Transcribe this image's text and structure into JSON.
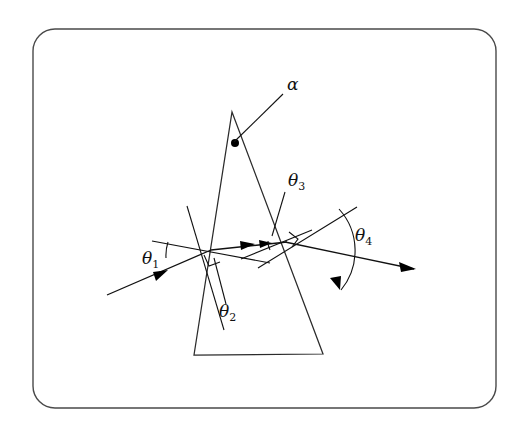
{
  "figure": {
    "kind": "optics-prism-refraction-diagram",
    "background_color": "#ffffff",
    "ink_color": "#111111",
    "frame_color": "#4a4a4a",
    "frame": {
      "x": 33,
      "y": 29,
      "width": 463,
      "height": 379,
      "corner_radius": 22
    },
    "prism": {
      "apex": [
        232,
        112
      ],
      "base_left": [
        194,
        355
      ],
      "base_right": [
        323,
        354
      ],
      "left_vertex_label": "apex-angle",
      "points": "232,112 323,354 194,355"
    },
    "vertex_dot": {
      "cx": 235,
      "cy": 143,
      "r": 4
    },
    "labels": [
      {
        "id": "alpha",
        "glyph": "α",
        "sub": "",
        "x": 287,
        "y": 90
      },
      {
        "id": "theta1",
        "glyph": "θ",
        "sub": "1",
        "x": 142,
        "y": 264
      },
      {
        "id": "theta2",
        "glyph": "θ",
        "sub": "2",
        "x": 219,
        "y": 317
      },
      {
        "id": "theta3",
        "glyph": "θ",
        "sub": "3",
        "x": 288,
        "y": 186
      },
      {
        "id": "theta4",
        "glyph": "θ",
        "sub": "4",
        "x": 355,
        "y": 241
      }
    ],
    "points_of_interest": {
      "entry_point": [
        211,
        250
      ],
      "exit_point": [
        285,
        242
      ],
      "incident_ray_start": [
        107,
        295
      ],
      "outgoing_ray_end": [
        412,
        268
      ]
    },
    "rays": {
      "incident": {
        "from": [
          107,
          295
        ],
        "to": [
          211,
          250
        ],
        "arrow_at": [
          163,
          272
        ]
      },
      "internal": {
        "from": [
          211,
          250
        ],
        "to": [
          285,
          242
        ],
        "arrow_at": [
          250,
          246
        ]
      },
      "outgoing": {
        "from": [
          285,
          242
        ],
        "to": [
          412,
          268
        ],
        "arrow_at": [
          410,
          267
        ]
      }
    },
    "normals": {
      "entry_normal": {
        "from": [
          187,
          206
        ],
        "to": [
          224,
          330
        ]
      },
      "entry_surface_tangent": {
        "from": [
          152,
          241
        ],
        "to": [
          270,
          263
        ]
      },
      "exit_normal": {
        "from": [
          258,
          266
        ],
        "to": [
          355,
          208
        ]
      },
      "exit_surface_tangent": {
        "from": [
          244,
          258
        ],
        "to": [
          310,
          231
        ]
      }
    },
    "alpha_leader": {
      "from": [
        234,
        142
      ],
      "to": [
        283,
        94
      ]
    },
    "theta3_leader": {
      "from": [
        283,
        192
      ],
      "to": [
        271,
        235
      ]
    },
    "theta2_leader": {
      "from": [
        214,
        258
      ],
      "to": [
        226,
        304
      ]
    },
    "arcs": [
      {
        "id": "theta1-arc",
        "cx": 211,
        "cy": 250,
        "r": 44,
        "from_deg": 190,
        "to_deg": 205
      },
      {
        "id": "theta3-arc",
        "cx": 285,
        "cy": 242,
        "r": 17,
        "from_deg": 175,
        "to_deg": 203
      },
      {
        "id": "theta4-arc",
        "cx": 285,
        "cy": 242,
        "r": 62,
        "from_deg": 330,
        "to_deg": 12
      }
    ],
    "right_angles": [
      {
        "id": "entry-right-angle",
        "x": 211,
        "y": 250,
        "size": 11
      },
      {
        "id": "exit-right-angle",
        "x": 285,
        "y": 242,
        "size": 10
      }
    ]
  }
}
